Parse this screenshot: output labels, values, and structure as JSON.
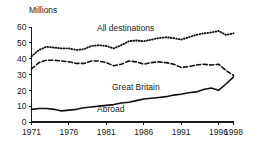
{
  "chart_data": {
    "type": "line",
    "title": "",
    "ylabel": "Millions",
    "xlabel": "",
    "ylim": [
      0,
      60
    ],
    "ytick_labels": [
      "0",
      "10",
      "20",
      "30",
      "40",
      "50",
      "60"
    ],
    "yticks": [
      0,
      10,
      20,
      30,
      40,
      50,
      60
    ],
    "xlim": [
      1971,
      1998
    ],
    "xtick_labels": [
      "1971",
      "1976",
      "1981",
      "1986",
      "1991",
      "1996",
      "1998"
    ],
    "xticks": [
      1971,
      1976,
      1981,
      1986,
      1991,
      1996,
      1998
    ],
    "grid": false,
    "legend_position": "inline-annotations",
    "x": [
      1971,
      1972,
      1973,
      1974,
      1975,
      1976,
      1977,
      1978,
      1979,
      1980,
      1981,
      1982,
      1983,
      1984,
      1985,
      1986,
      1987,
      1988,
      1989,
      1990,
      1991,
      1992,
      1993,
      1994,
      1995,
      1996,
      1997,
      1998
    ],
    "series": [
      {
        "name": "All destinations",
        "style": "dotted",
        "values": [
          41.5,
          45.5,
          47.5,
          47.0,
          46.5,
          46.5,
          45.5,
          46.0,
          48.0,
          48.5,
          48.0,
          46.5,
          48.5,
          51.0,
          51.5,
          51.0,
          52.0,
          53.0,
          53.5,
          53.0,
          52.0,
          53.5,
          55.0,
          56.0,
          56.5,
          57.5,
          55.0,
          56.0
        ]
      },
      {
        "name": "Great Britain",
        "style": "dashed",
        "values": [
          33.5,
          37.5,
          39.0,
          39.0,
          38.5,
          38.0,
          37.0,
          37.0,
          38.5,
          38.5,
          37.5,
          35.5,
          36.5,
          38.5,
          38.0,
          36.5,
          37.5,
          38.0,
          37.5,
          36.5,
          34.5,
          35.0,
          36.0,
          36.5,
          36.0,
          36.5,
          32.5,
          29.5
        ]
      },
      {
        "name": "Abroad",
        "style": "solid",
        "values": [
          8.0,
          8.5,
          8.5,
          8.0,
          7.0,
          7.5,
          8.0,
          9.0,
          9.5,
          10.0,
          10.5,
          11.0,
          12.0,
          12.5,
          13.5,
          14.5,
          15.0,
          15.5,
          16.0,
          17.0,
          17.5,
          18.5,
          19.0,
          20.5,
          21.5,
          20.0,
          24.0,
          28.5
        ]
      }
    ],
    "annotations": [
      {
        "text": "All destinations",
        "x_px": 97,
        "y_px": 31
      },
      {
        "text": "Great Britain",
        "x_px": 112,
        "y_px": 90
      },
      {
        "text": "Abroad",
        "x_px": 97,
        "y_px": 112
      }
    ]
  }
}
